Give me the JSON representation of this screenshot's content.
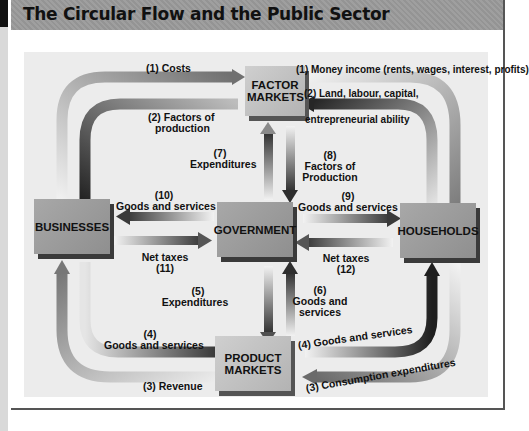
{
  "header": {
    "title": "The Circular Flow and the Public Sector"
  },
  "boxes": {
    "factor_markets": "FACTOR MARKETS",
    "businesses": "BUSINESSES",
    "government": "GOVERNMENT",
    "households": "HOUSEHOLDS",
    "product_markets": "PRODUCT MARKETS"
  },
  "flows": {
    "f1_costs": "(1) Costs",
    "f2_factors_num": "(2) Factors of",
    "f2_factors_word": "production",
    "f1_income": "(1) Money income (rents, wages, interest, profits)",
    "f2_land": "(2) Land, labour, capital,",
    "f2_entre": "entrepreneurial ability",
    "f7_num": "(7)",
    "f7_label": "Expenditures",
    "f8_num": "(8)",
    "f8_label1": "Factors of",
    "f8_label2": "Production",
    "f10_num": "(10)",
    "f10_label": "Goods and services",
    "f9_num": "(9)",
    "f9_label": "Goods and services",
    "f11_label": "Net taxes",
    "f11_num": "(11)",
    "f12_label": "Net taxes",
    "f12_num": "(12)",
    "f5_num": "(5)",
    "f5_label": "Expenditures",
    "f6_num": "(6)",
    "f6_label1": "Goods and",
    "f6_label2": "services",
    "f4_left_num": "(4)",
    "f4_left_label": "Goods and services",
    "f3_revenue": "(3) Revenue",
    "f4_right": "(4) Goods and services",
    "f3_consumption": "(3) Consumption expenditures"
  },
  "colors": {
    "header_bg": "#9a9a9a",
    "panel_bg": "#ececec",
    "arrow_dark": "#2e2e2e",
    "arrow_light": "#f2f2f2"
  }
}
